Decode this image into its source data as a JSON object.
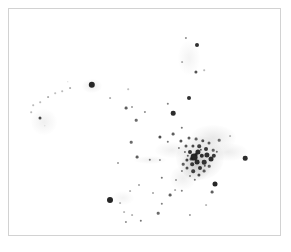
{
  "figure": {
    "title": "",
    "background_color": "#ffffff",
    "frame_color": "#d2d2d2",
    "point_color": "#1a1a1a",
    "haze_color": "#cfcfcf",
    "width": 291,
    "height": 252
  },
  "chart_data": {
    "type": "scatter",
    "title": "",
    "xlabel": "",
    "ylabel": "",
    "xlim": [
      0,
      273
    ],
    "ylim": [
      0,
      228
    ],
    "grid": false,
    "legend": null,
    "axis_ticks": [],
    "series": [
      {
        "name": "core-cluster",
        "points": [
          {
            "x": 194,
            "y": 157,
            "r": 3.4,
            "o": 0.95
          },
          {
            "x": 198,
            "y": 152,
            "r": 2.6,
            "o": 0.92
          },
          {
            "x": 202,
            "y": 156,
            "r": 2.2,
            "o": 0.9
          },
          {
            "x": 190,
            "y": 152,
            "r": 2.0,
            "o": 0.88
          },
          {
            "x": 197,
            "y": 162,
            "r": 2.4,
            "o": 0.9
          },
          {
            "x": 204,
            "y": 162,
            "r": 2.3,
            "o": 0.88
          },
          {
            "x": 192,
            "y": 164,
            "r": 1.8,
            "o": 0.85
          },
          {
            "x": 187,
            "y": 160,
            "r": 1.6,
            "o": 0.8
          },
          {
            "x": 200,
            "y": 168,
            "r": 2.0,
            "o": 0.86
          },
          {
            "x": 207,
            "y": 155,
            "r": 2.6,
            "o": 0.9
          },
          {
            "x": 211,
            "y": 159,
            "r": 2.5,
            "o": 0.9
          },
          {
            "x": 214,
            "y": 156,
            "r": 2.2,
            "o": 0.86
          },
          {
            "x": 206,
            "y": 149,
            "r": 2.0,
            "o": 0.85
          },
          {
            "x": 199,
            "y": 146,
            "r": 1.8,
            "o": 0.82
          },
          {
            "x": 193,
            "y": 146,
            "r": 1.6,
            "o": 0.78
          },
          {
            "x": 186,
            "y": 146,
            "r": 1.5,
            "o": 0.72
          },
          {
            "x": 181,
            "y": 141,
            "r": 1.6,
            "o": 0.75
          },
          {
            "x": 189,
            "y": 138,
            "r": 1.5,
            "o": 0.7
          },
          {
            "x": 196,
            "y": 139,
            "r": 1.4,
            "o": 0.68
          },
          {
            "x": 203,
            "y": 141,
            "r": 1.7,
            "o": 0.75
          },
          {
            "x": 209,
            "y": 143,
            "r": 1.5,
            "o": 0.7
          },
          {
            "x": 193,
            "y": 171,
            "r": 1.8,
            "o": 0.82
          },
          {
            "x": 187,
            "y": 168,
            "r": 1.5,
            "o": 0.75
          },
          {
            "x": 199,
            "y": 175,
            "r": 1.6,
            "o": 0.78
          },
          {
            "x": 204,
            "y": 171,
            "r": 1.4,
            "o": 0.7
          },
          {
            "x": 183,
            "y": 164,
            "r": 1.3,
            "o": 0.68
          },
          {
            "x": 191,
            "y": 159,
            "r": 1.4,
            "o": 0.78
          },
          {
            "x": 196,
            "y": 154,
            "r": 1.3,
            "o": 0.75
          },
          {
            "x": 201,
            "y": 150,
            "r": 1.2,
            "o": 0.7
          },
          {
            "x": 188,
            "y": 156,
            "r": 1.2,
            "o": 0.68
          },
          {
            "x": 185,
            "y": 152,
            "r": 1.1,
            "o": 0.62
          },
          {
            "x": 205,
            "y": 166,
            "r": 1.2,
            "o": 0.66
          },
          {
            "x": 209,
            "y": 166,
            "r": 1.3,
            "o": 0.68
          },
          {
            "x": 213,
            "y": 150,
            "r": 1.3,
            "o": 0.66
          },
          {
            "x": 217,
            "y": 152,
            "r": 1.2,
            "o": 0.62
          },
          {
            "x": 179,
            "y": 148,
            "r": 1.1,
            "o": 0.55
          },
          {
            "x": 182,
            "y": 171,
            "r": 1.1,
            "o": 0.55
          },
          {
            "x": 195,
            "y": 180,
            "r": 1.2,
            "o": 0.6
          },
          {
            "x": 190,
            "y": 176,
            "r": 1.0,
            "o": 0.55
          }
        ]
      },
      {
        "name": "upper-stream",
        "points": [
          {
            "x": 186,
            "y": 38,
            "r": 1.1,
            "o": 0.5
          },
          {
            "x": 197,
            "y": 45,
            "r": 2.0,
            "o": 0.9
          },
          {
            "x": 182,
            "y": 62,
            "r": 0.9,
            "o": 0.35
          },
          {
            "x": 196,
            "y": 72,
            "r": 1.6,
            "o": 0.75
          },
          {
            "x": 204,
            "y": 70,
            "r": 0.8,
            "o": 0.3
          },
          {
            "x": 189,
            "y": 98,
            "r": 2.0,
            "o": 0.9
          },
          {
            "x": 173,
            "y": 113,
            "r": 2.3,
            "o": 0.92
          },
          {
            "x": 173,
            "y": 134,
            "r": 1.4,
            "o": 0.7
          },
          {
            "x": 182,
            "y": 128,
            "r": 1.2,
            "o": 0.6
          },
          {
            "x": 168,
            "y": 142,
            "r": 1.2,
            "o": 0.6
          },
          {
            "x": 160,
            "y": 137,
            "r": 1.6,
            "o": 0.78
          }
        ]
      },
      {
        "name": "left-arc",
        "points": [
          {
            "x": 92,
            "y": 85,
            "r": 3.2,
            "o": 0.95
          },
          {
            "x": 70,
            "y": 88,
            "r": 0.9,
            "o": 0.35
          },
          {
            "x": 62,
            "y": 91,
            "r": 0.8,
            "o": 0.3
          },
          {
            "x": 55,
            "y": 93,
            "r": 0.8,
            "o": 0.28
          },
          {
            "x": 68,
            "y": 82,
            "r": 0.7,
            "o": 0.25
          },
          {
            "x": 48,
            "y": 97,
            "r": 0.9,
            "o": 0.35
          },
          {
            "x": 40,
            "y": 102,
            "r": 0.8,
            "o": 0.3
          },
          {
            "x": 33,
            "y": 105,
            "r": 0.8,
            "o": 0.3
          },
          {
            "x": 31,
            "y": 112,
            "r": 0.8,
            "o": 0.3
          },
          {
            "x": 40,
            "y": 118,
            "r": 1.5,
            "o": 0.78
          },
          {
            "x": 45,
            "y": 126,
            "r": 0.7,
            "o": 0.22
          },
          {
            "x": 110,
            "y": 98,
            "r": 0.9,
            "o": 0.35
          },
          {
            "x": 126,
            "y": 108,
            "r": 1.4,
            "o": 0.7
          },
          {
            "x": 132,
            "y": 107,
            "r": 1.0,
            "o": 0.45
          },
          {
            "x": 136,
            "y": 120,
            "r": 1.3,
            "o": 0.65
          },
          {
            "x": 131,
            "y": 142,
            "r": 1.3,
            "o": 0.65
          },
          {
            "x": 118,
            "y": 163,
            "r": 1.0,
            "o": 0.45
          },
          {
            "x": 137,
            "y": 157,
            "r": 1.4,
            "o": 0.7
          },
          {
            "x": 150,
            "y": 160,
            "r": 1.2,
            "o": 0.6
          },
          {
            "x": 160,
            "y": 160,
            "r": 1.1,
            "o": 0.5
          }
        ]
      },
      {
        "name": "lower-stream",
        "points": [
          {
            "x": 110,
            "y": 200,
            "r": 3.0,
            "o": 0.95
          },
          {
            "x": 120,
            "y": 203,
            "r": 0.9,
            "o": 0.3
          },
          {
            "x": 124,
            "y": 212,
            "r": 0.9,
            "o": 0.3
          },
          {
            "x": 132,
            "y": 215,
            "r": 0.9,
            "o": 0.32
          },
          {
            "x": 126,
            "y": 222,
            "r": 1.1,
            "o": 0.5
          },
          {
            "x": 141,
            "y": 221,
            "r": 1.2,
            "o": 0.6
          },
          {
            "x": 158,
            "y": 213,
            "r": 1.3,
            "o": 0.65
          },
          {
            "x": 162,
            "y": 204,
            "r": 1.2,
            "o": 0.55
          },
          {
            "x": 170,
            "y": 195,
            "r": 1.4,
            "o": 0.7
          },
          {
            "x": 175,
            "y": 190,
            "r": 0.9,
            "o": 0.35
          },
          {
            "x": 182,
            "y": 191,
            "r": 1.2,
            "o": 0.55
          },
          {
            "x": 162,
            "y": 178,
            "r": 1.2,
            "o": 0.6
          },
          {
            "x": 176,
            "y": 180,
            "r": 1.0,
            "o": 0.45
          },
          {
            "x": 153,
            "y": 193,
            "r": 1.0,
            "o": 0.4
          },
          {
            "x": 139,
            "y": 185,
            "r": 1.0,
            "o": 0.42
          },
          {
            "x": 130,
            "y": 191,
            "r": 0.9,
            "o": 0.32
          }
        ]
      },
      {
        "name": "outliers",
        "points": [
          {
            "x": 215,
            "y": 184,
            "r": 2.5,
            "o": 0.95
          },
          {
            "x": 212,
            "y": 192,
            "r": 1.4,
            "o": 0.7
          },
          {
            "x": 245,
            "y": 158,
            "r": 2.3,
            "o": 0.92
          },
          {
            "x": 219,
            "y": 140,
            "r": 1.3,
            "o": 0.62
          },
          {
            "x": 168,
            "y": 104,
            "r": 1.2,
            "o": 0.55
          },
          {
            "x": 145,
            "y": 112,
            "r": 1.1,
            "o": 0.5
          },
          {
            "x": 128,
            "y": 89,
            "r": 0.8,
            "o": 0.28
          },
          {
            "x": 230,
            "y": 136,
            "r": 0.9,
            "o": 0.3
          },
          {
            "x": 206,
            "y": 205,
            "r": 0.9,
            "o": 0.3
          },
          {
            "x": 190,
            "y": 215,
            "r": 1.1,
            "o": 0.45
          }
        ]
      }
    ],
    "haze_blobs": [
      {
        "x": 200,
        "y": 158,
        "w": 48,
        "h": 44,
        "o": 0.34
      },
      {
        "x": 196,
        "y": 166,
        "w": 30,
        "h": 30,
        "o": 0.3
      },
      {
        "x": 213,
        "y": 138,
        "w": 46,
        "h": 26,
        "o": 0.2
      },
      {
        "x": 228,
        "y": 152,
        "w": 40,
        "h": 18,
        "o": 0.16
      },
      {
        "x": 172,
        "y": 150,
        "w": 34,
        "h": 16,
        "o": 0.13
      },
      {
        "x": 183,
        "y": 178,
        "w": 26,
        "h": 24,
        "o": 0.14
      },
      {
        "x": 44,
        "y": 122,
        "w": 26,
        "h": 26,
        "o": 0.13
      },
      {
        "x": 92,
        "y": 86,
        "w": 20,
        "h": 14,
        "o": 0.16
      },
      {
        "x": 150,
        "y": 160,
        "w": 32,
        "h": 8,
        "o": 0.12
      },
      {
        "x": 189,
        "y": 58,
        "w": 22,
        "h": 34,
        "o": 0.1
      },
      {
        "x": 123,
        "y": 198,
        "w": 22,
        "h": 14,
        "o": 0.1
      }
    ]
  }
}
